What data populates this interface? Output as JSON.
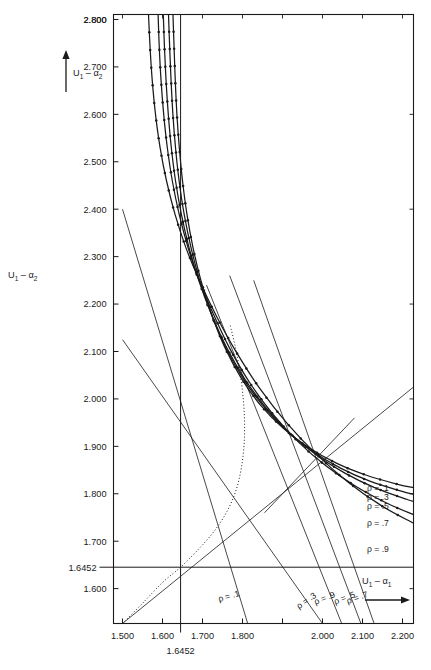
{
  "figure": {
    "title": "",
    "background": "#ffffff",
    "ink_color": "#1a1a1a"
  },
  "axes": {
    "x_axis_label": "U",
    "x_axis_label_sub": "1",
    "x_axis_label_rest": "– α",
    "x_axis_label_rest_sub": "1",
    "y_axis_label": "U",
    "y_axis_label_sub": "1",
    "y_axis_label_rest": "– α",
    "y_axis_label_rest_sub": "2",
    "x_ticks": [
      "1.500",
      "1.600",
      "1.700",
      "1.800",
      "1.900",
      "2.000",
      "2.100",
      "2.200"
    ],
    "x_tick_values": [
      1.5,
      1.6,
      1.7,
      1.8,
      1.9,
      2.0,
      2.1,
      2.2
    ],
    "x_labeled": [
      true,
      true,
      true,
      true,
      false,
      true,
      true,
      true
    ],
    "y_ticks": [
      "1.600",
      "1.700",
      "1.800",
      "1.900",
      "2.000",
      "2.100",
      "2.200",
      "2.300",
      "2.400",
      "2.500",
      "2.600",
      "2.700",
      "2.800"
    ],
    "y_tick_values": [
      1.6,
      1.7,
      1.8,
      1.9,
      2.0,
      2.1,
      2.2,
      2.3,
      2.4,
      2.5,
      2.6,
      2.7,
      2.8
    ],
    "x_special_tick": "1.6452",
    "x_special_value": 1.6452,
    "y_special_tick": "1.6452",
    "y_special_value": 1.6452,
    "xlim": [
      1.4775,
      2.2275
    ],
    "ylim": [
      1.5265,
      2.8105
    ]
  },
  "chart_data": {
    "type": "line",
    "title": "",
    "xlabel": "U1 - alpha1",
    "ylabel": "U1 - alpha2",
    "xlim": [
      1.4775,
      2.2275
    ],
    "ylim": [
      1.5265,
      2.8105
    ],
    "grid": false,
    "legend_position": "right-inside",
    "series": [
      {
        "name": "ρ = .1",
        "rho": 0.1,
        "style": "solid-dotted-markers",
        "legend_label": "ρ = .1",
        "points": [
          [
            1.6262,
            2.8105
          ],
          [
            1.629,
            2.74
          ],
          [
            1.632,
            2.67
          ],
          [
            1.636,
            2.6
          ],
          [
            1.642,
            2.53
          ],
          [
            1.65,
            2.46
          ],
          [
            1.661,
            2.39
          ],
          [
            1.676,
            2.32
          ],
          [
            1.696,
            2.25
          ],
          [
            1.722,
            2.18
          ],
          [
            1.755,
            2.11
          ],
          [
            1.796,
            2.045
          ],
          [
            1.845,
            1.987
          ],
          [
            1.902,
            1.938
          ],
          [
            1.966,
            1.897
          ],
          [
            2.036,
            1.864
          ],
          [
            2.11,
            1.839
          ],
          [
            2.188,
            1.82
          ],
          [
            2.2275,
            1.813
          ]
        ]
      },
      {
        "name": "ρ = .3",
        "rho": 0.3,
        "style": "solid-dotted-markers",
        "legend_label": "ρ = .3",
        "points": [
          [
            1.615,
            2.8105
          ],
          [
            1.618,
            2.74
          ],
          [
            1.6215,
            2.67
          ],
          [
            1.626,
            2.6
          ],
          [
            1.6325,
            2.53
          ],
          [
            1.6415,
            2.46
          ],
          [
            1.654,
            2.39
          ],
          [
            1.671,
            2.32
          ],
          [
            1.693,
            2.25
          ],
          [
            1.7215,
            2.18
          ],
          [
            1.757,
            2.11
          ],
          [
            1.8,
            2.045
          ],
          [
            1.851,
            1.986
          ],
          [
            1.909,
            1.934
          ],
          [
            1.974,
            1.89
          ],
          [
            2.045,
            1.854
          ],
          [
            2.12,
            1.826
          ],
          [
            2.199,
            1.805
          ],
          [
            2.2275,
            1.799
          ]
        ]
      },
      {
        "name": "ρ = .5",
        "rho": 0.5,
        "style": "solid-dotted-markers",
        "legend_label": "ρ = .5",
        "points": [
          [
            1.602,
            2.8105
          ],
          [
            1.605,
            2.74
          ],
          [
            1.609,
            2.67
          ],
          [
            1.6145,
            2.6
          ],
          [
            1.622,
            2.53
          ],
          [
            1.6325,
            2.46
          ],
          [
            1.647,
            2.39
          ],
          [
            1.666,
            2.32
          ],
          [
            1.6905,
            2.25
          ],
          [
            1.7215,
            2.18
          ],
          [
            1.7595,
            2.11
          ],
          [
            1.805,
            2.043
          ],
          [
            1.858,
            1.982
          ],
          [
            1.918,
            1.928
          ],
          [
            1.985,
            1.882
          ],
          [
            2.057,
            1.843
          ],
          [
            2.133,
            1.812
          ],
          [
            2.212,
            1.788
          ],
          [
            2.2275,
            1.784
          ]
        ]
      },
      {
        "name": "ρ = .7",
        "rho": 0.7,
        "style": "solid-dotted-markers",
        "legend_label": "ρ = .7",
        "points": [
          [
            1.589,
            2.8105
          ],
          [
            1.592,
            2.74
          ],
          [
            1.5965,
            2.67
          ],
          [
            1.603,
            2.6
          ],
          [
            1.612,
            2.53
          ],
          [
            1.6245,
            2.46
          ],
          [
            1.6415,
            2.39
          ],
          [
            1.6635,
            2.32
          ],
          [
            1.6915,
            2.25
          ],
          [
            1.7265,
            2.18
          ],
          [
            1.769,
            2.105
          ],
          [
            1.819,
            2.033
          ],
          [
            1.876,
            1.968
          ],
          [
            1.94,
            1.909
          ],
          [
            2.01,
            1.858
          ],
          [
            2.085,
            1.815
          ],
          [
            2.164,
            1.779
          ],
          [
            2.2275,
            1.756
          ]
        ]
      },
      {
        "name": "ρ = .9",
        "rho": 0.9,
        "style": "solid-dotted-markers",
        "legend_label": "ρ = .9",
        "points": [
          [
            1.565,
            2.8105
          ],
          [
            1.569,
            2.74
          ],
          [
            1.5745,
            2.67
          ],
          [
            1.5825,
            2.6
          ],
          [
            1.594,
            2.53
          ],
          [
            1.61,
            2.46
          ],
          [
            1.631,
            2.39
          ],
          [
            1.658,
            2.32
          ],
          [
            1.692,
            2.25
          ],
          [
            1.734,
            2.176
          ],
          [
            1.785,
            2.098
          ],
          [
            1.844,
            2.021
          ],
          [
            1.911,
            1.949
          ],
          [
            1.985,
            1.883
          ],
          [
            2.065,
            1.824
          ],
          [
            2.149,
            1.774
          ],
          [
            2.2275,
            1.738
          ]
        ]
      }
    ],
    "legend_entries": [
      {
        "label": "ρ = .1",
        "y_value": 1.812
      },
      {
        "label": "ρ = .3",
        "y_value": 1.793
      },
      {
        "label": "ρ = .5",
        "y_value": 1.775
      },
      {
        "label": "ρ = .7",
        "y_value": 1.738
      },
      {
        "label": "ρ = .9",
        "y_value": 1.684
      }
    ],
    "straight_lines": [
      {
        "name": "rho-line-.1",
        "label": "ρ = .1",
        "from": [
          1.5,
          2.4
        ],
        "to": [
          1.813,
          1.5265
        ],
        "label_at": [
          1.794,
          1.585
        ]
      },
      {
        "name": "rho-line-.3",
        "label": "ρ = .3",
        "from": [
          1.5,
          2.125
        ],
        "to": [
          2.0,
          1.5265
        ],
        "label_at": [
          1.986,
          1.583
        ]
      },
      {
        "name": "rho-line-.9",
        "label": "ρ = .9",
        "from": [
          1.71,
          2.24
        ],
        "to": [
          2.048,
          1.5265
        ],
        "label_at": [
          2.033,
          1.583
        ]
      },
      {
        "name": "rho-line-.5",
        "label": "ρ = .5",
        "from": [
          1.768,
          2.26
        ],
        "to": [
          2.096,
          1.5265
        ],
        "label_at": [
          2.083,
          1.583
        ]
      },
      {
        "name": "rho-line-.7",
        "label": "ρ = .7",
        "from": [
          1.828,
          2.25
        ],
        "to": [
          2.129,
          1.5265
        ],
        "label_at": [
          2.115,
          1.583
        ]
      },
      {
        "name": "diagonal-identity-line",
        "label": "",
        "from": [
          1.5,
          1.5265
        ],
        "to": [
          2.2275,
          2.025
        ],
        "label_at": null
      },
      {
        "name": "short-diagonal-line",
        "label": "",
        "from": [
          1.855,
          1.76
        ],
        "to": [
          2.08,
          1.96
        ],
        "label_at": null
      }
    ],
    "dotted_curve": {
      "name": "envelope-dotted-curve",
      "points": [
        [
          1.5,
          1.5265
        ],
        [
          1.55,
          1.569
        ],
        [
          1.6,
          1.613
        ],
        [
          1.6452,
          1.6452
        ],
        [
          1.69,
          1.683
        ],
        [
          1.73,
          1.722
        ],
        [
          1.762,
          1.764
        ],
        [
          1.784,
          1.808
        ],
        [
          1.797,
          1.854
        ],
        [
          1.804,
          1.904
        ],
        [
          1.805,
          1.956
        ],
        [
          1.801,
          2.008
        ],
        [
          1.793,
          2.06
        ],
        [
          1.782,
          2.11
        ],
        [
          1.769,
          2.156
        ]
      ]
    },
    "reference_lines": {
      "horizontal": {
        "name": "y-1.6452-line",
        "value": 1.6452,
        "label": "1.6452"
      },
      "vertical": {
        "name": "x-1.6452-line",
        "value": 1.6452,
        "label": "1.6452"
      }
    }
  },
  "annotations": {
    "y_arrow_label": "U₁ – α₂",
    "x_arrow_label": "U₁ – α₁"
  }
}
